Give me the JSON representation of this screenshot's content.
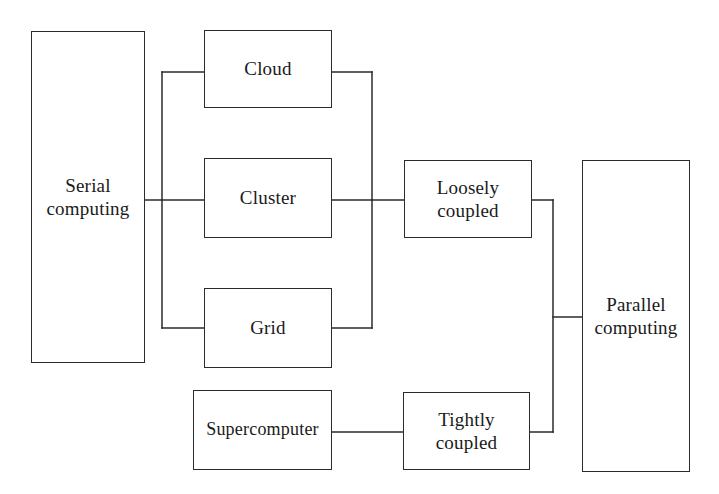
{
  "diagram": {
    "type": "block-diagram",
    "background_color": "#ffffff",
    "line_color": "#2b2b2b",
    "text_color": "#1a1a1a",
    "width": 719,
    "height": 494,
    "nodes": [
      {
        "id": "serial",
        "label": "Serial\ncomputing",
        "x": 31,
        "y": 31,
        "w": 114,
        "h": 332
      },
      {
        "id": "cloud",
        "label": "Cloud",
        "x": 204,
        "y": 30,
        "w": 128,
        "h": 78
      },
      {
        "id": "cluster",
        "label": "Cluster",
        "x": 204,
        "y": 158,
        "w": 128,
        "h": 80
      },
      {
        "id": "grid",
        "label": "Grid",
        "x": 204,
        "y": 288,
        "w": 128,
        "h": 80
      },
      {
        "id": "loosely",
        "label": "Loosely\ncoupled",
        "x": 404,
        "y": 160,
        "w": 128,
        "h": 78
      },
      {
        "id": "supercomputer",
        "label": "Supercomputer",
        "x": 193,
        "y": 390,
        "w": 139,
        "h": 80
      },
      {
        "id": "tightly",
        "label": "Tightly\ncoupled",
        "x": 403,
        "y": 392,
        "w": 127,
        "h": 78
      },
      {
        "id": "parallel",
        "label": "Parallel\ncomputing",
        "x": 582,
        "y": 160,
        "w": 108,
        "h": 312
      }
    ],
    "edges": [
      {
        "id": "serial-to-bus",
        "from": "serial",
        "to": "fan-out-bus"
      },
      {
        "id": "bus-to-cloud",
        "from": "fan-out-bus",
        "to": "cloud"
      },
      {
        "id": "bus-to-cluster",
        "from": "fan-out-bus",
        "to": "cluster"
      },
      {
        "id": "bus-to-grid",
        "from": "fan-out-bus",
        "to": "grid"
      },
      {
        "id": "cloud-to-collector",
        "from": "cloud",
        "to": "fan-in-bus"
      },
      {
        "id": "cluster-to-collector",
        "from": "cluster",
        "to": "fan-in-bus"
      },
      {
        "id": "grid-to-collector",
        "from": "grid",
        "to": "fan-in-bus"
      },
      {
        "id": "collector-to-loosely",
        "from": "fan-in-bus",
        "to": "loosely"
      },
      {
        "id": "supercomputer-to-tightly",
        "from": "supercomputer",
        "to": "tightly"
      },
      {
        "id": "loosely-to-parallel-bus",
        "from": "loosely",
        "to": "parallel-bus"
      },
      {
        "id": "tightly-to-parallel-bus",
        "from": "tightly",
        "to": "parallel-bus"
      },
      {
        "id": "parallel-bus-to-parallel",
        "from": "parallel-bus",
        "to": "parallel"
      }
    ]
  }
}
